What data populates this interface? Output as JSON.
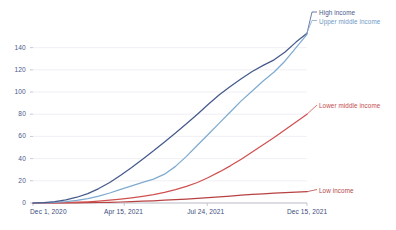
{
  "chart_data": {
    "type": "line",
    "title": "",
    "subtitle": "",
    "xlabel": "",
    "ylabel": "",
    "grid": true,
    "legend_position": "right-inline",
    "ylim": [
      0,
      155
    ],
    "yticks": [
      0,
      20,
      40,
      60,
      80,
      100,
      120,
      140
    ],
    "ytick_labels": [
      "0",
      "20",
      "40",
      "60",
      "80",
      "100",
      "120",
      "140"
    ],
    "x": [
      0,
      0.04,
      0.08,
      0.12,
      0.16,
      0.2,
      0.24,
      0.28,
      0.32,
      0.36,
      0.4,
      0.44,
      0.48,
      0.52,
      0.56,
      0.6,
      0.64,
      0.68,
      0.72,
      0.76,
      0.8,
      0.84,
      0.88,
      0.92,
      0.96,
      1.0
    ],
    "xticks": [
      0,
      0.333,
      0.636,
      1.0
    ],
    "xtick_labels": [
      "Dec 1, 2020",
      "Apr 15, 2021",
      "Jul 24, 2021",
      "Dec 15, 2021"
    ],
    "series": [
      {
        "name": "High income",
        "color": "#46598c",
        "label": "High income",
        "values": [
          0,
          0.4,
          1.2,
          2.8,
          5.2,
          8.5,
          13,
          18.5,
          25,
          32,
          39.5,
          47,
          55,
          63,
          71.5,
          80,
          89,
          97.5,
          105,
          112,
          118.5,
          124,
          129,
          136,
          145,
          153
        ]
      },
      {
        "name": "Upper middle income",
        "color": "#7fabcf",
        "label": "Upper middle income",
        "values": [
          0,
          0.2,
          0.6,
          1.3,
          2.4,
          4.0,
          6.2,
          9.0,
          12.2,
          15.5,
          18.5,
          21.5,
          26,
          33,
          42,
          52,
          62,
          72,
          82,
          92,
          101,
          110,
          118,
          128,
          140,
          152
        ]
      },
      {
        "name": "Lower middle income",
        "color": "#d05050",
        "label": "Lower middle income",
        "values": [
          0,
          0.1,
          0.2,
          0.4,
          0.7,
          1.1,
          1.7,
          2.5,
          3.5,
          4.7,
          6.0,
          7.5,
          9.5,
          12,
          15,
          18.5,
          23,
          28,
          33.5,
          39.5,
          46,
          52.5,
          59,
          66,
          73,
          80
        ]
      },
      {
        "name": "Low income",
        "color": "#b84242",
        "label": "Low income",
        "values": [
          0,
          0.02,
          0.05,
          0.1,
          0.18,
          0.3,
          0.45,
          0.65,
          0.9,
          1.2,
          1.6,
          2.0,
          2.5,
          3.0,
          3.6,
          4.2,
          4.9,
          5.6,
          6.3,
          7.0,
          7.7,
          8.3,
          8.9,
          9.4,
          9.8,
          10.2
        ]
      }
    ],
    "colors": {
      "high_income": "#46598c",
      "upper_middle_income": "#7fabcf",
      "lower_middle_income": "#d05050",
      "low_income": "#b84242",
      "grid": "#ececf2",
      "axis": "#b8bcc8",
      "tick_text": "#4a5a8a"
    }
  }
}
